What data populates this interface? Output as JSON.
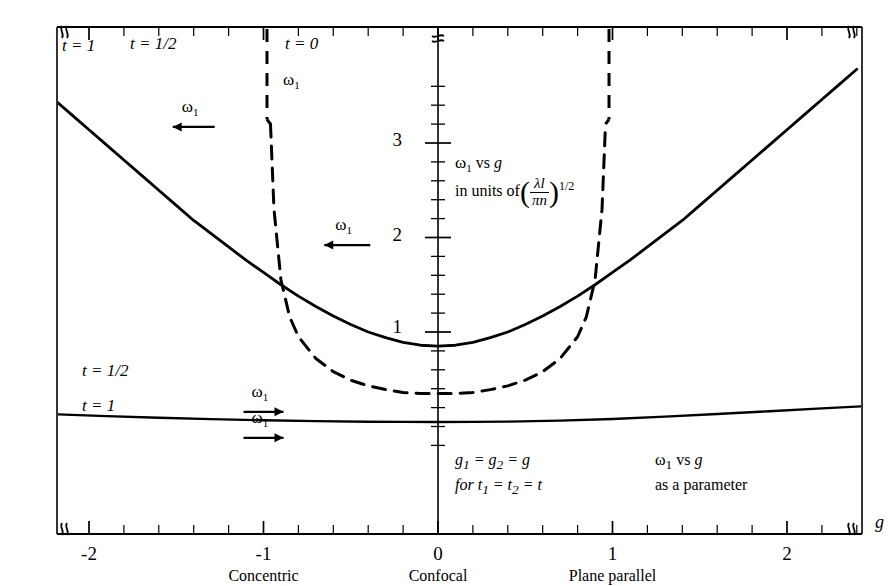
{
  "chart_data": {
    "type": "line",
    "title": "",
    "xlabel": "g",
    "ylabel": "",
    "xlim": [
      -2.52,
      2.62
    ],
    "ylim": [
      -0.35,
      3.72
    ],
    "grid": false,
    "legend_position": "inline-annotations",
    "x_ticks": [
      -2,
      -1,
      0,
      1,
      2
    ],
    "x_tick_labels": [
      "-2",
      "-1",
      "0",
      "1",
      "2"
    ],
    "x_minor_tick_step": 0.2,
    "y_ticks": [
      1,
      2,
      3
    ],
    "y_tick_labels": [
      "1",
      "2",
      "3"
    ],
    "y_minor_tick_step": 0.2,
    "axis_break_symbol": "≈",
    "units_note_line1": "ω₁ vs g",
    "units_note_line2": "in units of",
    "units_fraction_numerator": "λl",
    "units_fraction_denominator": "πn",
    "units_exponent": "1/2",
    "condition_line1": "g₁ = g₂ = g",
    "condition_line2": "for t₁ = t₂ = t",
    "parameter_line1": "ω₁ vs g",
    "parameter_line2": "as a parameter",
    "category_labels": [
      {
        "x": -1,
        "label": "Concentric"
      },
      {
        "x": 0,
        "label": "Confocal"
      },
      {
        "x": 1,
        "label": "Plane parallel"
      }
    ],
    "series": [
      {
        "name": "t = 1/2",
        "style": "solid",
        "label": "t = 1/2",
        "label_x": -1.76,
        "label_y": 3.62,
        "arrow_label": "ω₁",
        "arrow_direction": "left",
        "arrow_x": -1.38,
        "arrow_y": 3.3,
        "x": [
          -2.4,
          -2.3,
          -2.2,
          -2.1,
          -2.0,
          -1.9,
          -1.8,
          -1.7,
          -1.6,
          -1.5,
          -1.4,
          -1.3,
          -1.2,
          -1.1,
          -1.0,
          -0.9,
          -0.8,
          -0.7,
          -0.6,
          -0.5,
          -0.4,
          -0.3,
          -0.2,
          -0.1,
          0.0,
          0.1,
          0.2,
          0.3,
          0.4,
          0.5,
          0.6,
          0.7,
          0.8,
          0.9,
          1.0,
          1.1,
          1.2,
          1.3,
          1.4,
          1.5,
          1.6,
          1.7,
          1.8,
          1.9,
          2.0,
          2.1,
          2.2,
          2.3,
          2.4
        ],
        "y": [
          3.78,
          3.62,
          3.46,
          3.3,
          3.14,
          2.98,
          2.82,
          2.66,
          2.5,
          2.34,
          2.18,
          2.04,
          1.9,
          1.76,
          1.63,
          1.5,
          1.38,
          1.27,
          1.17,
          1.08,
          1.0,
          0.94,
          0.89,
          0.86,
          0.85,
          0.86,
          0.89,
          0.94,
          1.0,
          1.08,
          1.17,
          1.27,
          1.38,
          1.5,
          1.63,
          1.76,
          1.9,
          2.04,
          2.18,
          2.34,
          2.5,
          2.66,
          2.82,
          2.98,
          3.14,
          3.3,
          3.46,
          3.62,
          3.78
        ]
      },
      {
        "name": "t = 0",
        "style": "dashed",
        "label": "t = 0",
        "label_x": -0.83,
        "label_y": 3.62,
        "arrow_label": "ω₁",
        "arrow_direction": "none",
        "arrow_x": -0.83,
        "arrow_y": 3.3,
        "arrow2_label": "ω₁",
        "arrow2_direction": "left",
        "arrow2_x": -0.5,
        "arrow2_y": 2.0,
        "asymptotes": [
          -0.98,
          0.98
        ],
        "x": [
          -0.96,
          -0.94,
          -0.9,
          -0.85,
          -0.8,
          -0.7,
          -0.6,
          -0.5,
          -0.4,
          -0.3,
          -0.2,
          -0.1,
          0.0,
          0.1,
          0.2,
          0.3,
          0.4,
          0.5,
          0.6,
          0.7,
          0.8,
          0.85,
          0.9,
          0.94,
          0.96
        ],
        "y": [
          3.2,
          2.3,
          1.55,
          1.16,
          0.95,
          0.72,
          0.58,
          0.49,
          0.43,
          0.39,
          0.36,
          0.35,
          0.35,
          0.35,
          0.36,
          0.39,
          0.43,
          0.49,
          0.58,
          0.72,
          0.95,
          1.16,
          1.55,
          2.3,
          3.2
        ]
      },
      {
        "name": "t = 1",
        "style": "solid",
        "label_top": "t = 1/2",
        "label_top_x": -1.85,
        "label_top_y": 0.22,
        "arrow_top_label": "ω₁",
        "arrow_top_direction": "right",
        "arrow_top_x": -1.02,
        "arrow_top_y": 0.22,
        "label_bottom": "t = 1",
        "label_bottom_x": -1.82,
        "label_bottom_y": -0.06,
        "arrow_bottom_label": "ω₁",
        "arrow_bottom_direction": "right",
        "arrow_bottom_x": -1.02,
        "arrow_bottom_y": -0.06,
        "x": [
          -2.52,
          -2.2,
          -1.9,
          -1.6,
          -1.3,
          -1.0,
          -0.7,
          -0.4,
          -0.2,
          0.0,
          0.2,
          0.4,
          0.7,
          1.0,
          1.3,
          1.6,
          1.9,
          2.2,
          2.5,
          2.62
        ],
        "y": [
          0.155,
          0.13,
          0.11,
          0.092,
          0.078,
          0.066,
          0.057,
          0.051,
          0.049,
          0.048,
          0.049,
          0.052,
          0.062,
          0.08,
          0.104,
          0.132,
          0.162,
          0.192,
          0.22,
          0.232
        ]
      }
    ]
  },
  "axis_labels": {
    "x_axis_symbol": "g",
    "y_values": [
      "1",
      "2",
      "3"
    ],
    "x_values": [
      "-2",
      "-1",
      "0",
      "1",
      "2"
    ]
  }
}
